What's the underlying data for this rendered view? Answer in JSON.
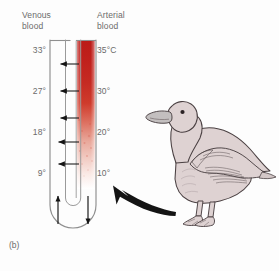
{
  "figure": {
    "panel_label": "(b)",
    "headers": {
      "left": "Venous\nblood",
      "left_line1": "Venous",
      "left_line2": "blood",
      "right_line1": "Arterial",
      "right_line2": "blood"
    },
    "venous_temperatures": [
      "33°",
      "27°",
      "18°",
      "9°"
    ],
    "arterial_temperatures": [
      "35°C",
      "30°",
      "20°",
      "10°"
    ],
    "colors": {
      "hot_blood": "#c0201c",
      "warm_blood": "#cf3b2c",
      "cool_blood": "#e8b7ad",
      "cold_blood": "#ffffff",
      "tube_outline": "#8a8a8a",
      "arrow": "#1a1a1a",
      "text": "#6b6b6b",
      "bird_body": "#ded2d2",
      "bird_outline": "#4a4042",
      "bird_beak": "#bdbdbd",
      "background": "#fdfdfd"
    },
    "icons": {
      "heat_transfer_arrow": "left-arrow-icon",
      "venous_flow_arrow": "up-arrow-icon",
      "arterial_flow_arrow": "down-arrow-icon",
      "pointer_arrow": "thick-pointer-arrow-icon",
      "bird": "duck-illustration-icon"
    },
    "heat_arrow_count": 5,
    "caption_notes": "Countercurrent heat exchange in a duck leg"
  }
}
